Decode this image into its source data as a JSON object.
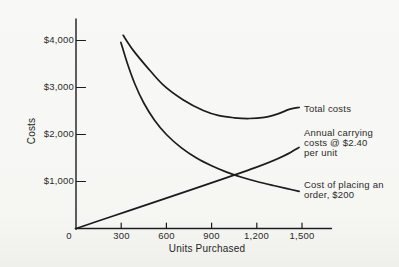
{
  "colors": {
    "background": "#f6f6f3",
    "line_ink": "#1c1c1c",
    "text_ink": "#2b2b2b"
  },
  "chart_data": {
    "type": "line",
    "title": "",
    "xlabel": "Units Purchased",
    "ylabel": "Costs",
    "x_tick_values": [
      0,
      300,
      600,
      900,
      1200,
      1500
    ],
    "x_tick_labels": [
      "0",
      "300",
      "600",
      "900",
      "1,200",
      "1,500"
    ],
    "y_tick_values": [
      1000,
      2000,
      3000,
      4000
    ],
    "y_tick_labels": [
      "$1,000",
      "$2,000",
      "$3,000",
      "$4,000"
    ],
    "xlim": [
      0,
      1700
    ],
    "ylim": [
      0,
      4450
    ],
    "grid": false,
    "legend_position": "inline-right-annotations",
    "series": [
      {
        "name": "Total costs",
        "label_lines": "Total costs",
        "points": [
          [
            313,
            4110
          ],
          [
            380,
            3790
          ],
          [
            470,
            3440
          ],
          [
            580,
            3050
          ],
          [
            710,
            2740
          ],
          [
            845,
            2510
          ],
          [
            950,
            2400
          ],
          [
            1050,
            2355
          ],
          [
            1150,
            2340
          ],
          [
            1250,
            2365
          ],
          [
            1340,
            2440
          ],
          [
            1420,
            2540
          ],
          [
            1481,
            2575
          ]
        ]
      },
      {
        "name": "Annual carrying costs @ $2.40 per unit",
        "label_lines": "Annual carrying\ncosts @ $2.40\nper unit",
        "points": [
          [
            0,
            0
          ],
          [
            1190,
            1295
          ],
          [
            1480,
            1725
          ]
        ]
      },
      {
        "name": "Cost of placing an order, $200",
        "label_lines": "Cost of placing an\norder, $200",
        "points": [
          [
            298,
            3960
          ],
          [
            340,
            3520
          ],
          [
            390,
            3080
          ],
          [
            450,
            2670
          ],
          [
            520,
            2310
          ],
          [
            600,
            2000
          ],
          [
            700,
            1715
          ],
          [
            800,
            1500
          ],
          [
            900,
            1335
          ],
          [
            1000,
            1200
          ],
          [
            1100,
            1090
          ],
          [
            1200,
            1000
          ],
          [
            1310,
            915
          ],
          [
            1400,
            850
          ],
          [
            1481,
            790
          ]
        ]
      }
    ]
  }
}
